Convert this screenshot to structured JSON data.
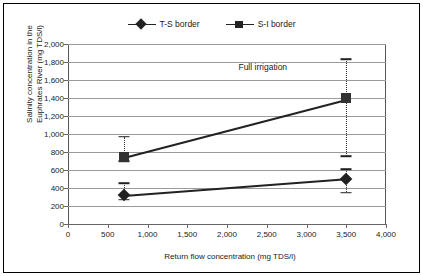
{
  "chart_data": {
    "type": "line",
    "title": "",
    "xlabel": "Return flow concentration (mg TDS/l)",
    "ylabel_line1": "Salinity concentration in the",
    "ylabel_line2": "Euphrates River (mg TDS/l)",
    "xlim": [
      0,
      4000
    ],
    "ylim": [
      0,
      2000
    ],
    "x": [
      700,
      3500
    ],
    "grid": true,
    "legend_position": "top-center",
    "xticks": [
      0,
      500,
      1000,
      1500,
      2000,
      2500,
      3000,
      3500,
      4000
    ],
    "xtick_labels": [
      "0",
      "500",
      "1,000",
      "1,500",
      "2,000",
      "2,500",
      "3,000",
      "3,500",
      "4,000"
    ],
    "yticks": [
      0,
      200,
      400,
      600,
      800,
      1000,
      1200,
      1400,
      1600,
      1800,
      2000
    ],
    "ytick_labels": [
      "0",
      "200",
      "400",
      "600",
      "800",
      "1,000",
      "1,200",
      "1,400",
      "1,600",
      "1,800",
      "2,000"
    ],
    "series": [
      {
        "name": "T-S border",
        "marker": "diamond",
        "values": [
          320,
          505
        ],
        "error_low": [
          270,
          350
        ],
        "error_high": [
          455,
          610
        ]
      },
      {
        "name": "S-I border",
        "marker": "square",
        "values": [
          750,
          1395
        ],
        "error_low": [
          700,
          755
        ],
        "error_high": [
          970,
          1830
        ]
      }
    ],
    "annotations": [
      {
        "text": "Full irrigation",
        "x": 2450,
        "y": 1750
      }
    ]
  },
  "legend": {
    "entries": [
      {
        "label": "T-S border",
        "marker": "diamond"
      },
      {
        "label": "S-I border",
        "marker": "square"
      }
    ]
  },
  "colors": {
    "series": "#222222",
    "grid": "#9a9a9a",
    "axis": "#666666",
    "frame": "#000000",
    "background": "#ffffff"
  }
}
